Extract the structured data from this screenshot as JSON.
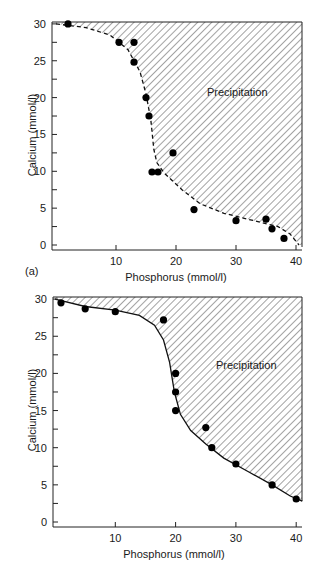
{
  "chart_data": [
    {
      "type": "scatter",
      "panel_label": "(a)",
      "title": "",
      "xlabel": "Phosphorus (mmol/l)",
      "ylabel": "Calcium (mmol/l)",
      "xlim": [
        0,
        41
      ],
      "ylim": [
        0,
        30
      ],
      "xticks": [
        10,
        20,
        30,
        40
      ],
      "yticks": [
        0,
        5,
        10,
        15,
        20,
        25,
        30
      ],
      "grid": false,
      "region_label": "Precipitation",
      "boundary_style": "dashed",
      "series": [
        {
          "name": "Observations",
          "points": [
            [
              2,
              30
            ],
            [
              10.5,
              27.5
            ],
            [
              13,
              27.5
            ],
            [
              13,
              24.8
            ],
            [
              15,
              20
            ],
            [
              15.5,
              17.5
            ],
            [
              16,
              9.9
            ],
            [
              17,
              9.9
            ],
            [
              19.5,
              12.5
            ],
            [
              23,
              4.8
            ],
            [
              30,
              3.3
            ],
            [
              35,
              3.5
            ],
            [
              36,
              2.2
            ],
            [
              38,
              0.9
            ]
          ]
        },
        {
          "name": "Solubility boundary",
          "points": [
            [
              0,
              30
            ],
            [
              5,
              29.5
            ],
            [
              9,
              28.5
            ],
            [
              12,
              26.5
            ],
            [
              14,
              23.5
            ],
            [
              15,
              20.5
            ],
            [
              15.8,
              17
            ],
            [
              16.3,
              13
            ],
            [
              16.8,
              11.2
            ],
            [
              18,
              9.8
            ],
            [
              21,
              7.5
            ],
            [
              24,
              5.6
            ],
            [
              28,
              4.3
            ],
            [
              33,
              3.3
            ],
            [
              37,
              2.5
            ],
            [
              39,
              1.5
            ],
            [
              40.5,
              0
            ]
          ]
        }
      ]
    },
    {
      "type": "scatter",
      "panel_label": "",
      "title": "",
      "xlabel": "Phosphorus (mmol/l)",
      "ylabel": "Calcium (mmol/l)",
      "xlim": [
        0,
        41
      ],
      "ylim": [
        0,
        30
      ],
      "xticks": [
        10,
        20,
        30,
        40
      ],
      "yticks": [
        0,
        5,
        10,
        15,
        20,
        25,
        30
      ],
      "grid": false,
      "region_label": "Precipitation",
      "boundary_style": "solid",
      "series": [
        {
          "name": "Observations",
          "points": [
            [
              1,
              29.5
            ],
            [
              5,
              28.7
            ],
            [
              10,
              28.3
            ],
            [
              18,
              27.2
            ],
            [
              20,
              20
            ],
            [
              20,
              17.5
            ],
            [
              20,
              15
            ],
            [
              25,
              12.7
            ],
            [
              26,
              10
            ],
            [
              30,
              7.8
            ],
            [
              36,
              5
            ],
            [
              40,
              3.1
            ]
          ]
        },
        {
          "name": "Solubility boundary",
          "points": [
            [
              0,
              30
            ],
            [
              5,
              29
            ],
            [
              10,
              28.5
            ],
            [
              14,
              27.8
            ],
            [
              16.5,
              26.5
            ],
            [
              18,
              24.5
            ],
            [
              19,
              21.5
            ],
            [
              19.8,
              17.5
            ],
            [
              20.8,
              14.5
            ],
            [
              22.5,
              12.3
            ],
            [
              25,
              10.5
            ],
            [
              28,
              8.6
            ],
            [
              32,
              6.8
            ],
            [
              36,
              5
            ],
            [
              39,
              3.5
            ],
            [
              41,
              2.8
            ]
          ]
        }
      ]
    }
  ],
  "panels": [
    {
      "panel_label": "(a)",
      "xlabel": "Phosphorus (mmol/l)",
      "ylabel": "Calcium (mmol/l)",
      "region_label": "Precipitation",
      "xtick_labels": [
        "10",
        "20",
        "30",
        "40"
      ],
      "ytick_labels": [
        "0",
        "5",
        "10",
        "15",
        "20",
        "25",
        "30"
      ]
    },
    {
      "panel_label": "",
      "xlabel": "Phosphorus (mmol/l)",
      "ylabel": "Calcium (mmol/l)",
      "region_label": "Precipitation",
      "xtick_labels": [
        "10",
        "20",
        "30",
        "40"
      ],
      "ytick_labels": [
        "0",
        "5",
        "10",
        "15",
        "20",
        "25",
        "30"
      ]
    }
  ]
}
